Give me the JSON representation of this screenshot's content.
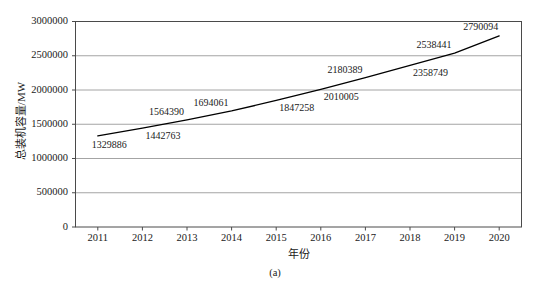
{
  "chart_data": {
    "type": "line",
    "title": "",
    "xlabel": "年份",
    "ylabel": "总装机容量/MW",
    "caption": "(a)",
    "categories": [
      "2011",
      "2012",
      "2013",
      "2014",
      "2015",
      "2016",
      "2017",
      "2018",
      "2019",
      "2020"
    ],
    "x": [
      2011,
      2012,
      2013,
      2014,
      2015,
      2016,
      2017,
      2018,
      2019,
      2020
    ],
    "values": [
      1329886,
      1442763,
      1564390,
      1694061,
      1847258,
      2010005,
      2180389,
      2358749,
      2538441,
      2790094
    ],
    "point_labels": [
      "1329886",
      "1442763",
      "1564390",
      "1694061",
      "1847258",
      "2010005",
      "2180389",
      "2358749",
      "2538441",
      "2790094"
    ],
    "label_positions": [
      "below",
      "below",
      "above",
      "above",
      "below",
      "below",
      "above",
      "below",
      "above",
      "above"
    ],
    "ylim": [
      0,
      3000000
    ],
    "yticks": [
      0,
      500000,
      1000000,
      1500000,
      2000000,
      2500000,
      3000000
    ],
    "ytick_labels": [
      "0",
      "500000",
      "1000000",
      "1500000",
      "2000000",
      "2500000",
      "3000000"
    ],
    "xlim": [
      2010.5,
      2020.5
    ],
    "grid": "horizontal",
    "legend": "none",
    "line_color": "#000000",
    "grid_color": "#9a9a9a",
    "frame_color": "#4a4a4a",
    "background": "#ffffff"
  }
}
